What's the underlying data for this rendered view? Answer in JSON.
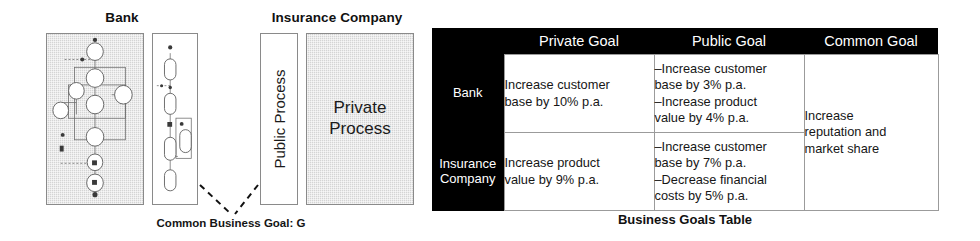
{
  "diagram": {
    "bank": {
      "title": "Bank",
      "private_process_label": "",
      "public_process_label": ""
    },
    "insurance": {
      "title": "Insurance Company",
      "public_process_label": "Public Process",
      "private_process_label": "Private\nProcess"
    },
    "common_goal_label": "Common Business Goal: G"
  },
  "table": {
    "caption": "Business Goals Table",
    "corner_header": "",
    "column_headers": [
      "Private Goal",
      "Public Goal",
      "Common Goal"
    ],
    "rows": [
      {
        "row_header": "Bank",
        "private_goal": "Increase customer\nbase by 10% p.a.",
        "public_goal": "–Increase customer\nbase by 3% p.a.\n–Increase product\nvalue by 4% p.a."
      },
      {
        "row_header": "Insurance\nCompany",
        "private_goal": "Increase product\nvalue by 9% p.a.",
        "public_goal": "–Increase customer\nbase by 7% p.a.\n–Decrease financial\ncosts by 5% p.a."
      }
    ],
    "common_goal": "Increase\nreputation and\nmarket share"
  },
  "colors": {
    "header_background": "#000000",
    "header_text": "#ffffff",
    "cell_background": "#ffffff",
    "cell_text": "#161616",
    "cell_border": "#9b9b9b",
    "private_process_fill": "#d4d4d4",
    "public_process_fill": "#ffffff",
    "box_border": "#8a8a8a"
  }
}
